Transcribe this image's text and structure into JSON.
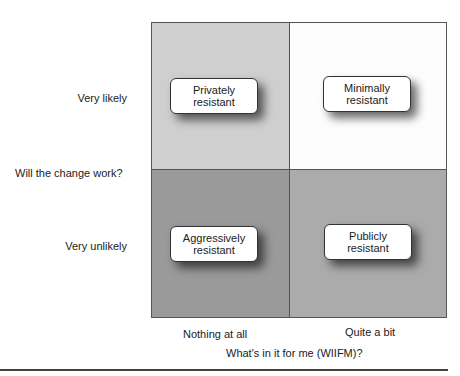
{
  "y_axis": {
    "title": "Will the change work?",
    "ticks": [
      "Very likely",
      "Very unlikely"
    ]
  },
  "x_axis": {
    "title": "What's in it for me (WIIFM)?",
    "ticks": [
      "Nothing at all",
      "Quite a bit"
    ]
  },
  "quadrants": [
    {
      "position": "top-left",
      "line1": "Privately",
      "line2": "resistant",
      "color": "#cfcfcf"
    },
    {
      "position": "top-right",
      "line1": "Minimally",
      "line2": "resistant",
      "color": "#fdfdfd"
    },
    {
      "position": "bottom-left",
      "line1": "Aggressively",
      "line2": "resistant",
      "color": "#9a9a9a"
    },
    {
      "position": "bottom-right",
      "line1": "Publicly",
      "line2": "resistant",
      "color": "#ababab"
    }
  ]
}
